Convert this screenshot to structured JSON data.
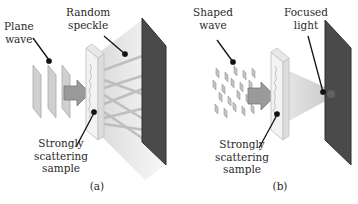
{
  "panels": [
    {
      "id": "a",
      "caption": "(a)",
      "labels": {
        "input_wave": [
          "Plane",
          "wave"
        ],
        "output": [
          "Random",
          "speckle"
        ],
        "sample": [
          "Strongly",
          "scattering",
          "sample"
        ]
      }
    },
    {
      "id": "b",
      "caption": "(b)",
      "labels": {
        "input_wave": [
          "Shaped",
          "wave"
        ],
        "output": [
          "Focused",
          "light"
        ],
        "sample": [
          "Strongly",
          "scattering",
          "sample"
        ]
      }
    }
  ],
  "colors": {
    "screen": "#4a4a4a",
    "screen_edge": "#2e2e2e",
    "sample_face": "#f4f4f4",
    "sample_edge": "#cfcfcf",
    "wavefront": "#c8c8c8",
    "arrow": "#9a9a9a",
    "light_cone": "#d9d9d9",
    "pointer": "#111111"
  }
}
